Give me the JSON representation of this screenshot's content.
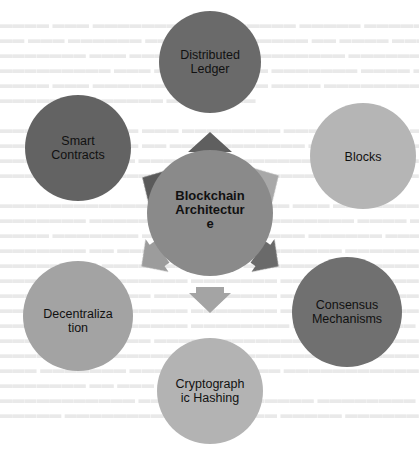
{
  "diagram": {
    "type": "radial-hub-and-spoke",
    "center": {
      "label": "Blockchain Architecture",
      "display_lines": [
        "Blockchain",
        "Architectur",
        "e"
      ],
      "color": "#8a8a8a"
    },
    "nodes": [
      {
        "id": "distributed-ledger",
        "label": "Distributed Ledger",
        "display_lines": [
          "Distributed",
          "Ledger"
        ],
        "color": "#6b6b6b",
        "position": "top"
      },
      {
        "id": "blocks",
        "label": "Blocks",
        "display_lines": [
          "Blocks"
        ],
        "color": "#b5b5b5",
        "position": "upper-right"
      },
      {
        "id": "consensus-mechanisms",
        "label": "Consensus Mechanisms",
        "display_lines": [
          "Consensus",
          "Mechanisms"
        ],
        "color": "#6f6f6f",
        "position": "lower-right"
      },
      {
        "id": "cryptographic-hashing",
        "label": "Cryptographic Hashing",
        "display_lines": [
          "Cryptograph",
          "ic Hashing"
        ],
        "color": "#b3b3b3",
        "position": "bottom"
      },
      {
        "id": "decentralization",
        "label": "Decentralization",
        "display_lines": [
          "Decentraliza",
          "tion"
        ],
        "color": "#a3a3a3",
        "position": "lower-left"
      },
      {
        "id": "smart-contracts",
        "label": "Smart Contracts",
        "display_lines": [
          "Smart",
          "Contracts"
        ],
        "color": "#646464",
        "position": "upper-left"
      }
    ],
    "arrows": [
      {
        "to": "distributed-ledger",
        "color": "#5e5e5e"
      },
      {
        "to": "blocks",
        "color": "#a8a8a8"
      },
      {
        "to": "consensus-mechanisms",
        "color": "#6a6a6a"
      },
      {
        "to": "cryptographic-hashing",
        "color": "#a4a4a4"
      },
      {
        "to": "decentralization",
        "color": "#9c9c9c"
      },
      {
        "to": "smart-contracts",
        "color": "#5a5a5a"
      }
    ]
  },
  "labels": {
    "center_l1": "Blockchain",
    "center_l2": "Architectur",
    "center_l3": "e",
    "ledger_l1": "Distributed",
    "ledger_l2": "Ledger",
    "blocks_l1": "Blocks",
    "consensus_l1": "Consensus",
    "consensus_l2": "Mechanisms",
    "hashing_l1": "Cryptograph",
    "hashing_l2": "ic Hashing",
    "decent_l1": "Decentraliza",
    "decent_l2": "tion",
    "smart_l1": "Smart",
    "smart_l2": "Contracts"
  }
}
